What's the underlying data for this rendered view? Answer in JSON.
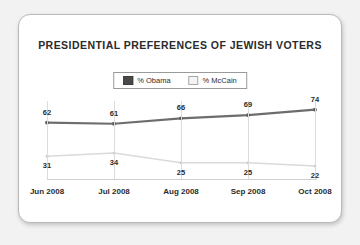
{
  "card": {
    "title": "PRESIDENTIAL PREFERENCES OF JEWISH VOTERS"
  },
  "legend": {
    "entries": [
      {
        "label": "% Obama",
        "swatch": "obama",
        "color": "#4a4a4a"
      },
      {
        "label": "% McCain",
        "swatch": "mccain",
        "color": "#f4f4f4"
      }
    ]
  },
  "chart_data": {
    "type": "line",
    "title": "PRESIDENTIAL PREFERENCES OF JEWISH VOTERS",
    "xlabel": "",
    "ylabel": "",
    "ylim": [
      0,
      100
    ],
    "grid": "vertical",
    "legend_position": "top-center",
    "categories": [
      "Jun 2008",
      "Jul 2008",
      "Aug 2008",
      "Sep 2008",
      "Oct 2008"
    ],
    "series": [
      {
        "name": "% Obama",
        "color": "#6d6d6d",
        "values": [
          62,
          61,
          66,
          69,
          74
        ]
      },
      {
        "name": "% McCain",
        "color": "#dadada",
        "values": [
          31,
          34,
          25,
          25,
          22
        ]
      }
    ]
  }
}
